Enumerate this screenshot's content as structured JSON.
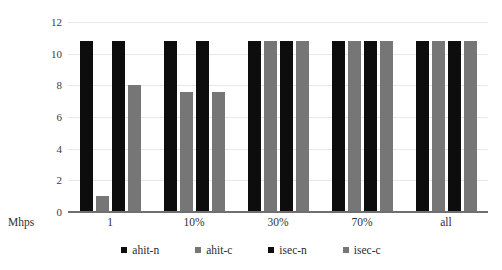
{
  "chart_data": {
    "type": "bar",
    "title": "",
    "subtitle": "",
    "xlabel": "Mhps",
    "ylabel": "",
    "categories": [
      "1",
      "10%",
      "30%",
      "70%",
      "all"
    ],
    "series": [
      {
        "name": "ahit-n",
        "color": "#0d0d0d",
        "values": [
          10.8,
          10.8,
          10.8,
          10.8,
          10.8
        ]
      },
      {
        "name": "ahit-c",
        "color": "#767676",
        "values": [
          1.0,
          7.6,
          10.8,
          10.8,
          10.8
        ]
      },
      {
        "name": "isec-n",
        "color": "#0d0d0d",
        "values": [
          10.8,
          10.8,
          10.8,
          10.8,
          10.8
        ]
      },
      {
        "name": "isec-c",
        "color": "#767676",
        "values": [
          8.0,
          7.6,
          10.8,
          10.8,
          10.8
        ]
      }
    ],
    "yticks": [
      0,
      2,
      4,
      6,
      8,
      10,
      12
    ],
    "ylim": [
      0,
      12
    ],
    "grid": true,
    "legend_position": "bottom"
  },
  "axis": {
    "y_tick_labels": [
      "12",
      "10",
      "8",
      "6",
      "4",
      "2",
      "0"
    ],
    "x_tick_labels": [
      "1",
      "10%",
      "30%",
      "70%",
      "all"
    ],
    "x_axis_title": "Mhps"
  },
  "legend": {
    "items": [
      {
        "label": "ahit-n",
        "color": "#0d0d0d"
      },
      {
        "label": "ahit-c",
        "color": "#767676"
      },
      {
        "label": "isec-n",
        "color": "#0d0d0d"
      },
      {
        "label": "isec-c",
        "color": "#767676"
      }
    ]
  }
}
